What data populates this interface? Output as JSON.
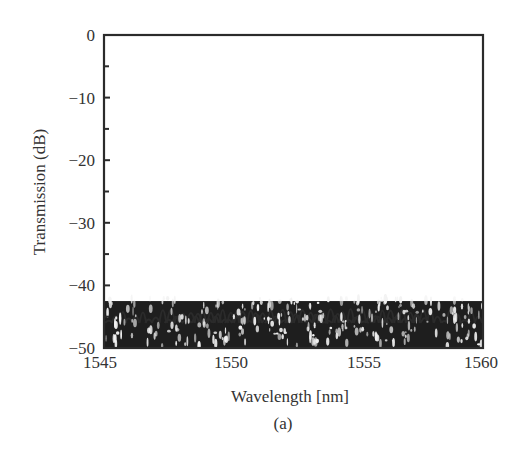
{
  "chart_data": {
    "type": "line",
    "title": "",
    "xlabel": "Wavelength [nm]",
    "ylabel": "Transmission (dB)",
    "caption": "(a)",
    "xlim": [
      1545,
      1560
    ],
    "ylim": [
      -50,
      0
    ],
    "x_ticks": [
      1545,
      1550,
      1555,
      1560
    ],
    "x_tick_labels": [
      "1545",
      "1550",
      "1555",
      "1560"
    ],
    "y_ticks": [
      0,
      -10,
      -20,
      -30,
      -40,
      -50
    ],
    "y_tick_labels": [
      "0",
      "−10",
      "−20",
      "−30",
      "−40",
      "−50"
    ],
    "y_minor_ticks": [
      -5,
      -15,
      -25,
      -35,
      -45
    ],
    "grid": false,
    "legend": null,
    "line_color": "#2b2b2b",
    "channel_count": 16,
    "channel_spacing_nm": 0.8,
    "series": [
      {
        "name": "Ch1",
        "center_nm": 1546.7,
        "peak_db": -0.5
      },
      {
        "name": "Ch2",
        "center_nm": 1547.49,
        "peak_db": -0.5
      },
      {
        "name": "Ch3",
        "center_nm": 1548.28,
        "peak_db": -0.5
      },
      {
        "name": "Ch4",
        "center_nm": 1549.07,
        "peak_db": -0.5
      },
      {
        "name": "Ch5",
        "center_nm": 1549.86,
        "peak_db": -0.5
      },
      {
        "name": "Ch6",
        "center_nm": 1550.65,
        "peak_db": -0.5
      },
      {
        "name": "Ch7",
        "center_nm": 1551.44,
        "peak_db": -0.5
      },
      {
        "name": "Ch8",
        "center_nm": 1552.23,
        "peak_db": -0.5
      },
      {
        "name": "Ch9",
        "center_nm": 1553.02,
        "peak_db": -0.5
      },
      {
        "name": "Ch10",
        "center_nm": 1553.81,
        "peak_db": -0.5
      },
      {
        "name": "Ch11",
        "center_nm": 1554.6,
        "peak_db": -0.5
      },
      {
        "name": "Ch12",
        "center_nm": 1555.39,
        "peak_db": -0.5
      },
      {
        "name": "Ch13",
        "center_nm": 1556.18,
        "peak_db": -0.5
      },
      {
        "name": "Ch14",
        "center_nm": 1556.97,
        "peak_db": -0.5
      },
      {
        "name": "Ch15",
        "center_nm": 1557.76,
        "peak_db": -0.5
      },
      {
        "name": "Ch16",
        "center_nm": 1558.59,
        "peak_db": -0.5
      }
    ],
    "passband_shape": {
      "model": "parabolic_in_dB",
      "curvature_db_per_nm2": 50,
      "adjacent_crossing_db": -8
    },
    "noise_floor": {
      "range_db": [
        -50,
        -40
      ],
      "sidelobe_peak_db": -39
    }
  }
}
